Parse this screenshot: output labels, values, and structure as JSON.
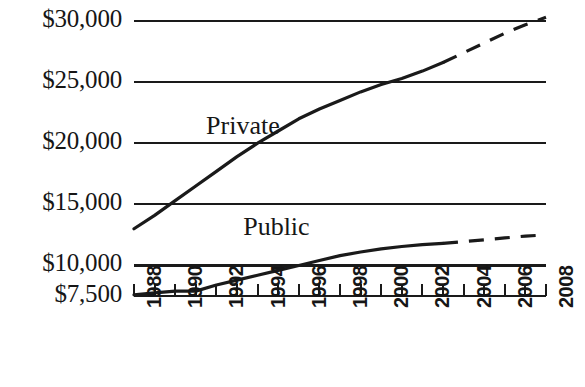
{
  "chart_data": {
    "type": "line",
    "title": "",
    "subtitle": "",
    "xlabel": "",
    "ylabel": "",
    "grid": true,
    "legend_position": "inline-annotation",
    "xlim": [
      1988,
      2008
    ],
    "ylim": [
      7500,
      30000
    ],
    "x": [
      1988,
      1989,
      1990,
      1991,
      1992,
      1993,
      1994,
      1995,
      1996,
      1997,
      1998,
      1999,
      2000,
      2001,
      2002,
      2003,
      2004,
      2005,
      2006,
      2007,
      2008
    ],
    "x_tick_labels": [
      "1988",
      "1990",
      "1992",
      "1994",
      "1996",
      "1998",
      "2000",
      "2002",
      "2004",
      "2006",
      "2008"
    ],
    "y_tick_labels": [
      "$30,000",
      "$25,000",
      "$20,000",
      "$15,000",
      "$10,000",
      "$7,500"
    ],
    "y_ticks": [
      30000,
      25000,
      20000,
      15000,
      10000,
      7500
    ],
    "series": [
      {
        "name": "Private",
        "style": "solid-then-dashed",
        "dash_starts_at": 2003,
        "values": [
          13000,
          14100,
          15300,
          16500,
          17700,
          18900,
          20000,
          21000,
          22000,
          22800,
          23500,
          24200,
          24800,
          25300,
          25900,
          26600,
          27400,
          28200,
          29000,
          29700,
          30300
        ]
      },
      {
        "name": "Public",
        "style": "solid-then-dashed",
        "dash_starts_at": 2003,
        "values": [
          7600,
          7750,
          7900,
          7900,
          8400,
          8800,
          9200,
          9600,
          10000,
          10400,
          10800,
          11100,
          11350,
          11550,
          11700,
          11800,
          11950,
          12100,
          12250,
          12400,
          12500
        ]
      }
    ],
    "annotations": [
      {
        "text": "Private",
        "x": 1991.5,
        "y": 21200
      },
      {
        "text": "Public",
        "x": 1993.3,
        "y": 12900
      }
    ]
  },
  "axis": {
    "y_labels": [
      "$30,000",
      "$25,000",
      "$20,000",
      "$15,000",
      "$10,000",
      "$7,500"
    ],
    "x_labels": [
      "1988",
      "1990",
      "1992",
      "1994",
      "1996",
      "1998",
      "2000",
      "2002",
      "2004",
      "2006",
      "2008"
    ]
  },
  "annotations": {
    "private": "Private",
    "public": "Public"
  },
  "colors": {
    "line": "#1a1a1a",
    "grid": "#1a1a1a",
    "background": "#ffffff",
    "text": "#161616"
  }
}
